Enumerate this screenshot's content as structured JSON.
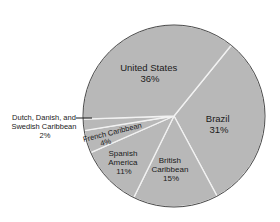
{
  "chart_data": {
    "type": "pie",
    "title": "",
    "categories": [
      "Brazil",
      "British Caribbean",
      "Spanish America",
      "French Caribbean",
      "Dutch, Danish, and Swedish Caribbean",
      "United States"
    ],
    "values": [
      31,
      15,
      11,
      4,
      2,
      36
    ],
    "unit": "%",
    "labels": [
      {
        "lines": [
          "Brazil",
          "31%"
        ]
      },
      {
        "lines": [
          "British",
          "Caribbean",
          "15%"
        ]
      },
      {
        "lines": [
          "Spanish",
          "America",
          "11%"
        ]
      },
      {
        "lines": [
          "French Caribbean",
          "4%"
        ]
      },
      {
        "lines": [
          "Dutch, Danish, and",
          "Swedish Caribbean",
          "2%"
        ]
      },
      {
        "lines": [
          "United States",
          "36%"
        ]
      }
    ],
    "legend": "none (direct labels)",
    "start_angle_deg": -51,
    "direction": "clockwise"
  },
  "colors": {
    "slice_fill": "#b8b8b8",
    "slice_separator": "#f2f2f2",
    "outline": "#4a4a4a",
    "text": "#1a1a1a"
  }
}
